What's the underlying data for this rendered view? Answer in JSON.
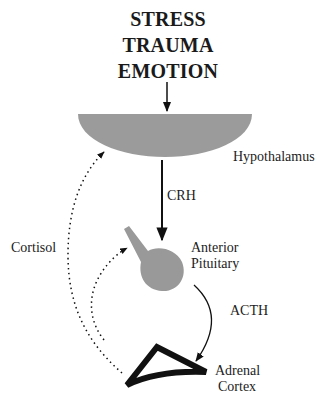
{
  "diagram": {
    "title_lines": [
      "STRESS",
      "TRAUMA",
      "EMOTION"
    ],
    "nodes": {
      "hypothalamus": {
        "label": "Hypothalamus",
        "color": "#9b9b9b"
      },
      "anterior_pituitary": {
        "label_line1": "Anterior",
        "label_line2": "Pituitary",
        "color": "#999999"
      },
      "adrenal_cortex": {
        "label_line1": "Adrenal",
        "label_line2": "Cortex",
        "color": "#111111"
      }
    },
    "edges": {
      "crh": {
        "label": "CRH",
        "from": "hypothalamus",
        "to": "anterior_pituitary",
        "style": "solid"
      },
      "acth": {
        "label": "ACTH",
        "from": "anterior_pituitary",
        "to": "adrenal_cortex",
        "style": "solid"
      },
      "cortisol": {
        "label": "Cortisol",
        "from": "adrenal_cortex",
        "to": [
          "hypothalamus",
          "anterior_pituitary"
        ],
        "style": "dotted"
      },
      "stress_input": {
        "from": "title",
        "to": "hypothalamus",
        "style": "solid"
      }
    }
  }
}
